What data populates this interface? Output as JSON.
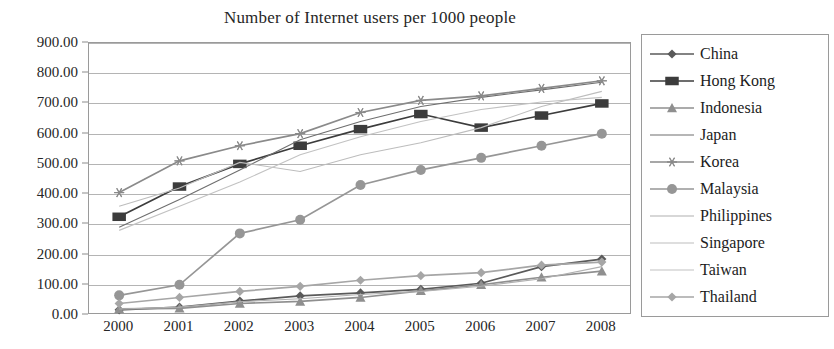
{
  "chart_data": {
    "type": "line",
    "title": "Number of Internet users per 1000 people",
    "xlabel": "",
    "ylabel": "",
    "categories": [
      "2000",
      "2001",
      "2002",
      "2003",
      "2004",
      "2005",
      "2006",
      "2007",
      "2008"
    ],
    "x": [
      2000,
      2001,
      2002,
      2003,
      2004,
      2005,
      2006,
      2007,
      2008
    ],
    "ylim": [
      0,
      900
    ],
    "y_ticks": [
      0,
      100,
      200,
      300,
      400,
      500,
      600,
      700,
      800,
      900
    ],
    "y_tick_labels": [
      "0.00",
      "100.00",
      "200.00",
      "300.00",
      "400.00",
      "500.00",
      "600.00",
      "700.00",
      "800.00",
      "900.00"
    ],
    "grid": true,
    "legend_position": "right",
    "series": [
      {
        "name": "China",
        "marker": "diamond",
        "color": "#5a5a5a",
        "values": [
          17,
          26,
          46,
          63,
          73,
          85,
          105,
          160,
          185
        ]
      },
      {
        "name": "Hong Kong",
        "marker": "square",
        "color": "#3c3c3c",
        "values": [
          325,
          425,
          500,
          560,
          615,
          665,
          620,
          660,
          700
        ]
      },
      {
        "name": "Indonesia",
        "marker": "triangle",
        "color": "#8f8f8f",
        "values": [
          20,
          22,
          38,
          45,
          58,
          80,
          100,
          125,
          145
        ]
      },
      {
        "name": "Japan",
        "marker": "none",
        "color": "#6e6e6e",
        "values": [
          290,
          382,
          480,
          580,
          640,
          690,
          720,
          745,
          770
        ]
      },
      {
        "name": "Korea",
        "marker": "star",
        "color": "#8a8a8a",
        "values": [
          405,
          510,
          560,
          600,
          670,
          710,
          725,
          750,
          775
        ]
      },
      {
        "name": "Malaysia",
        "marker": "circle",
        "color": "#969696",
        "values": [
          65,
          100,
          270,
          315,
          430,
          480,
          520,
          560,
          600
        ]
      },
      {
        "name": "Philippines",
        "marker": "none",
        "color": "#b0b0b0",
        "values": [
          20,
          26,
          44,
          54,
          68,
          78,
          95,
          120,
          160
        ]
      },
      {
        "name": "Singapore",
        "marker": "none",
        "color": "#bdbdbd",
        "values": [
          360,
          420,
          505,
          475,
          530,
          570,
          620,
          690,
          740
        ]
      },
      {
        "name": "Taiwan",
        "marker": "none",
        "color": "#c2c2c2",
        "values": [
          280,
          360,
          440,
          530,
          590,
          640,
          680,
          705,
          720
        ]
      },
      {
        "name": "Thailand",
        "marker": "diamond",
        "color": "#a6a6a6",
        "values": [
          38,
          58,
          78,
          95,
          115,
          130,
          140,
          165,
          175
        ]
      }
    ]
  },
  "legend": {
    "items": [
      {
        "label": "China"
      },
      {
        "label": "Hong Kong"
      },
      {
        "label": "Indonesia"
      },
      {
        "label": "Japan"
      },
      {
        "label": "Korea"
      },
      {
        "label": "Malaysia"
      },
      {
        "label": "Philippines"
      },
      {
        "label": "Singapore"
      },
      {
        "label": "Taiwan"
      },
      {
        "label": "Thailand"
      }
    ]
  },
  "colors": {
    "frame": "#9a9a9a",
    "gridline": "#b4b4b4",
    "text": "#262626",
    "background": "#ffffff"
  }
}
